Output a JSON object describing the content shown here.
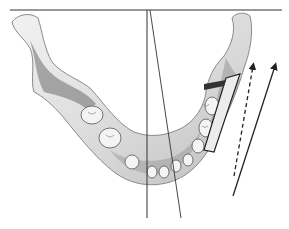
{
  "figure": {
    "colors": {
      "bone_fill": "#e6e6e6",
      "bone_shadow": "#7a7a7a",
      "bone_dark": "#4a4a4a",
      "line": "#222222",
      "background": "#ffffff"
    },
    "reference_lines": {
      "horizontal_top": {
        "x1": 10,
        "y1": 10,
        "x2": 282,
        "y2": 10
      },
      "vertical_midline": {
        "x1": 147,
        "y1": 10,
        "x2": 147,
        "y2": 218
      },
      "oblique_line": {
        "x1": 150,
        "y1": 10,
        "x2": 181,
        "y2": 218
      },
      "solid_arrow": {
        "x1": 233,
        "y1": 196,
        "x2": 276,
        "y2": 64
      },
      "dashed_arrow": {
        "x1": 234,
        "y1": 176,
        "x2": 254,
        "y2": 64
      }
    }
  }
}
